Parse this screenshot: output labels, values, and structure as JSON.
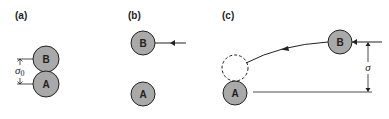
{
  "colors": {
    "ball_fill": "#a9a9a9",
    "stroke": "#222222",
    "background": "#ffffff"
  },
  "panels": [
    {
      "label": "(a)",
      "balls": [
        {
          "name": "B",
          "label": "B"
        },
        {
          "name": "A",
          "label": "A"
        }
      ],
      "dimension": {
        "symbol": "σ",
        "subscript": "0"
      }
    },
    {
      "label": "(b)",
      "balls": [
        {
          "name": "B",
          "label": "B"
        },
        {
          "name": "A",
          "label": "A"
        }
      ]
    },
    {
      "label": "(c)",
      "balls": [
        {
          "name": "B",
          "label": "B"
        },
        {
          "name": "A",
          "label": "A"
        }
      ],
      "dimension": {
        "symbol": "σ"
      }
    }
  ]
}
